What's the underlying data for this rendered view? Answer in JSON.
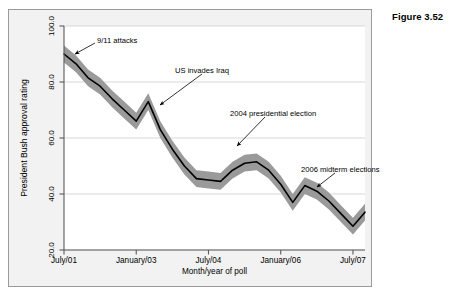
{
  "figure": {
    "label": "Figure 3.52"
  },
  "chart_data": {
    "type": "line",
    "title": "",
    "xlabel": "Month/year of poll",
    "ylabel": "President Bush approval rating",
    "ylim": [
      20.0,
      100.0
    ],
    "xlim": [
      0,
      25
    ],
    "grid": true,
    "grid_orientation": "horizontal",
    "legend_position": "none",
    "band_label": "margin of error band",
    "band_color": "#9a9a9a",
    "line_color": "#000000",
    "panel_color": "#f2f2f2",
    "plot_background": "#ffffff",
    "ytick_labels": [
      "100.0",
      "80.0",
      "60.0",
      "40.0",
      "20.0"
    ],
    "ytick_values": [
      100.0,
      80.0,
      60.0,
      40.0,
      20.0
    ],
    "xtick_labels": [
      "July/01",
      "January/03",
      "July/04",
      "January/06",
      "July/07"
    ],
    "xtick_values": [
      0,
      6,
      12,
      18,
      24
    ],
    "x": [
      0,
      1,
      2,
      3,
      4,
      5,
      6,
      7,
      8,
      9,
      10,
      11,
      12,
      13,
      14,
      15,
      16,
      17,
      18,
      19,
      20,
      21,
      22,
      23,
      24,
      25
    ],
    "series": [
      {
        "name": "Approval rating",
        "values": [
          90.0,
          86.5,
          81.5,
          78.5,
          74.0,
          70.0,
          66.0,
          73.0,
          63.0,
          56.0,
          50.0,
          45.5,
          45.0,
          44.5,
          48.5,
          51.0,
          51.5,
          48.5,
          43.5,
          37.0,
          43.0,
          41.0,
          37.5,
          33.0,
          28.5,
          33.5
        ]
      },
      {
        "name": "Upper confidence bound",
        "values": [
          93.0,
          89.5,
          84.5,
          81.5,
          77.0,
          73.0,
          69.0,
          76.0,
          66.0,
          59.0,
          53.0,
          48.5,
          48.0,
          47.5,
          51.5,
          54.0,
          54.5,
          51.5,
          46.5,
          40.0,
          46.0,
          44.0,
          40.5,
          36.0,
          31.5,
          36.5
        ]
      },
      {
        "name": "Lower confidence bound",
        "values": [
          87.0,
          83.5,
          78.5,
          75.5,
          71.0,
          67.0,
          63.0,
          70.0,
          60.0,
          53.0,
          47.0,
          42.5,
          42.0,
          41.5,
          45.5,
          48.0,
          48.5,
          45.5,
          40.5,
          34.0,
          40.0,
          38.0,
          34.5,
          30.0,
          25.5,
          30.5
        ]
      }
    ],
    "annotations": [
      {
        "id": "annotation-911",
        "text": "9/11 attacks",
        "label_x": 88,
        "label_y": 26,
        "arrow_from_x": 86,
        "arrow_from_y": 33,
        "arrow_to_x": 66,
        "arrow_to_y": 44
      },
      {
        "id": "annotation-iraq",
        "text": "US invades Iraq",
        "label_x": 166,
        "label_y": 56,
        "arrow_from_x": 193,
        "arrow_from_y": 64,
        "arrow_to_x": 151,
        "arrow_to_y": 95
      },
      {
        "id": "annotation-2004-election",
        "text": "2004 presidential election",
        "label_x": 221,
        "label_y": 99,
        "arrow_from_x": 256,
        "arrow_from_y": 107,
        "arrow_to_x": 228,
        "arrow_to_y": 136
      },
      {
        "id": "annotation-2006-midterms",
        "text": "2006 midterm elections",
        "label_x": 292,
        "label_y": 155,
        "arrow_from_x": 326,
        "arrow_from_y": 163,
        "arrow_to_x": 308,
        "arrow_to_y": 177
      }
    ]
  }
}
